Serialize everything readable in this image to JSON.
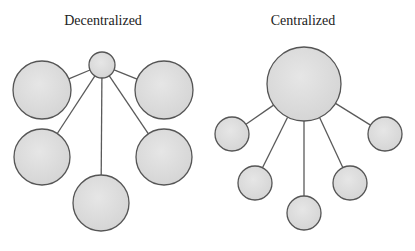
{
  "colors": {
    "background": "#ffffff",
    "node_fill": "#dcdcdc",
    "node_fill_light": "#e8e8e8",
    "node_stroke": "#555555",
    "edge": "#5a5a5a",
    "text": "#222222"
  },
  "panels": [
    {
      "id": "decentralized",
      "title": "Decentralized",
      "title_pos": {
        "x": 103,
        "y": 25
      },
      "hub": {
        "cx": 102,
        "cy": 65,
        "r": 13
      },
      "nodes": [
        {
          "cx": 42,
          "cy": 90,
          "r": 29
        },
        {
          "cx": 164,
          "cy": 90,
          "r": 29
        },
        {
          "cx": 42,
          "cy": 157,
          "r": 28
        },
        {
          "cx": 164,
          "cy": 157,
          "r": 28
        },
        {
          "cx": 101,
          "cy": 203,
          "r": 28
        }
      ]
    },
    {
      "id": "centralized",
      "title": "Centralized",
      "title_pos": {
        "x": 303,
        "y": 25
      },
      "hub": {
        "cx": 304,
        "cy": 84,
        "r": 37
      },
      "nodes": [
        {
          "cx": 232,
          "cy": 134,
          "r": 17
        },
        {
          "cx": 385,
          "cy": 134,
          "r": 17
        },
        {
          "cx": 255,
          "cy": 183,
          "r": 17
        },
        {
          "cx": 350,
          "cy": 183,
          "r": 17
        },
        {
          "cx": 304,
          "cy": 213,
          "r": 17
        }
      ]
    }
  ]
}
